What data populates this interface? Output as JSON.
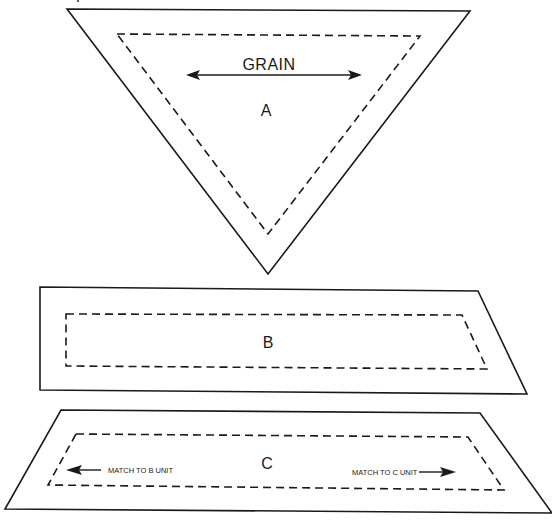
{
  "diagram": {
    "colors": {
      "ink": "#1a1a1a",
      "background": "#ffffff"
    },
    "pieces": [
      {
        "id": "A",
        "label": "A",
        "shape": "inverted-triangle",
        "grain_label": "GRAIN",
        "grain_arrow": "double-headed-horizontal",
        "cut_line": [
          [
            67,
            9
          ],
          [
            470,
            11
          ],
          [
            268,
            274
          ]
        ],
        "seam_line": [
          [
            117,
            34
          ],
          [
            420,
            36
          ],
          [
            268,
            234
          ]
        ]
      },
      {
        "id": "B",
        "label": "B",
        "shape": "right-slanted-trapezoid",
        "cut_line": [
          [
            40,
            287
          ],
          [
            478,
            291
          ],
          [
            527,
            394
          ],
          [
            40,
            390
          ]
        ],
        "seam_line": [
          [
            66,
            314
          ],
          [
            462,
            315
          ],
          [
            487,
            369
          ],
          [
            66,
            366
          ]
        ]
      },
      {
        "id": "C",
        "label": "C",
        "shape": "isosceles-trapezoid",
        "cut_line": [
          [
            61,
            410
          ],
          [
            480,
            413
          ],
          [
            552,
            513
          ],
          [
            5,
            509
          ]
        ],
        "seam_line": [
          [
            76,
            434
          ],
          [
            468,
            437
          ],
          [
            504,
            490
          ],
          [
            48,
            485
          ]
        ],
        "left_note": "MATCH TO B UNIT",
        "right_note": "MATCH TO C UNIT"
      }
    ]
  }
}
